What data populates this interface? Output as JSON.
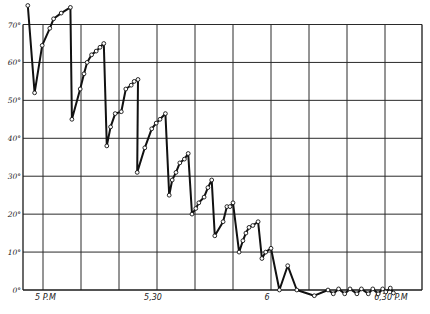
{
  "chart_data": {
    "type": "line",
    "title": "",
    "xlabel": "",
    "ylabel": "",
    "x_unit": "minutes after 5 P.M.",
    "xlim": [
      -2.6,
      49.9
    ],
    "ylim": [
      0,
      70
    ],
    "y_ticks": [
      {
        "value": 0,
        "label": "0°"
      },
      {
        "value": 10,
        "label": "10°"
      },
      {
        "value": 20,
        "label": "20°"
      },
      {
        "value": 30,
        "label": "30°"
      },
      {
        "value": 40,
        "label": "40°"
      },
      {
        "value": 50,
        "label": "50°"
      },
      {
        "value": 60,
        "label": "60°"
      },
      {
        "value": 70,
        "label": "70°"
      }
    ],
    "x_gridlines": [
      0,
      5,
      10,
      15,
      20,
      25,
      30,
      35,
      40,
      45
    ],
    "x_tick_labels": [
      {
        "value": 0,
        "label": "5 P.M"
      },
      {
        "value": 15,
        "label": "5,30"
      },
      {
        "value": 30,
        "label": "6"
      },
      {
        "value": 45,
        "label": "6,30 P.M"
      }
    ],
    "grid": true,
    "legend": null,
    "series": [
      {
        "name": "Temperature",
        "marker": "open-circle",
        "points": [
          [
            -2.0,
            75
          ],
          [
            -1.1,
            52
          ],
          [
            -0.1,
            64.5
          ],
          [
            0.9,
            69
          ],
          [
            1.4,
            71.5
          ],
          [
            2.4,
            73
          ],
          [
            3.6,
            74.5
          ],
          [
            3.8,
            45
          ],
          [
            4.9,
            53
          ],
          [
            5.4,
            57
          ],
          [
            5.8,
            60
          ],
          [
            6.4,
            62
          ],
          [
            7.0,
            63
          ],
          [
            7.5,
            64
          ],
          [
            8.0,
            65
          ],
          [
            8.4,
            38
          ],
          [
            8.9,
            43
          ],
          [
            9.5,
            46.5
          ],
          [
            10.3,
            47
          ],
          [
            10.9,
            53
          ],
          [
            11.6,
            54
          ],
          [
            12.0,
            55
          ],
          [
            12.5,
            55.5
          ],
          [
            12.4,
            31
          ],
          [
            13.4,
            37.5
          ],
          [
            14.3,
            42.5
          ],
          [
            14.9,
            44
          ],
          [
            15.4,
            45
          ],
          [
            16.1,
            46.5
          ],
          [
            16.6,
            25
          ],
          [
            17.0,
            29
          ],
          [
            17.5,
            31
          ],
          [
            18.0,
            33.5
          ],
          [
            18.6,
            34.5
          ],
          [
            19.1,
            36
          ],
          [
            19.6,
            20
          ],
          [
            20.1,
            21.5
          ],
          [
            20.5,
            23
          ],
          [
            21.2,
            24.5
          ],
          [
            21.7,
            27
          ],
          [
            22.2,
            29
          ],
          [
            22.6,
            14.3
          ],
          [
            23.7,
            18
          ],
          [
            24.2,
            22
          ],
          [
            24.6,
            22
          ],
          [
            25.0,
            23
          ],
          [
            25.8,
            10
          ],
          [
            26.3,
            13
          ],
          [
            26.7,
            15
          ],
          [
            27.1,
            16.5
          ],
          [
            27.6,
            17
          ],
          [
            28.3,
            18
          ],
          [
            28.8,
            8.3
          ],
          [
            29.3,
            10
          ],
          [
            30.0,
            11
          ],
          [
            31.1,
            0
          ],
          [
            32.2,
            6.4
          ],
          [
            33.4,
            0
          ],
          [
            35.7,
            -1.5
          ],
          [
            37.5,
            0
          ],
          [
            38.2,
            -1
          ],
          [
            38.9,
            0.3
          ],
          [
            39.7,
            -1
          ],
          [
            40.4,
            0.3
          ],
          [
            41.3,
            -1
          ],
          [
            41.9,
            0.3
          ],
          [
            42.8,
            -1
          ],
          [
            43.4,
            0.3
          ],
          [
            44.1,
            -1
          ],
          [
            44.7,
            0.3
          ],
          [
            45.1,
            -0.5
          ],
          [
            45.7,
            0.5
          ],
          [
            46.1,
            -0.8
          ]
        ]
      }
    ]
  },
  "layout": {
    "plot_left": 23,
    "plot_right": 422,
    "y0_px": 290,
    "y70_px": 24.5,
    "x0_px": 43,
    "px_per_minute": 7.6
  }
}
